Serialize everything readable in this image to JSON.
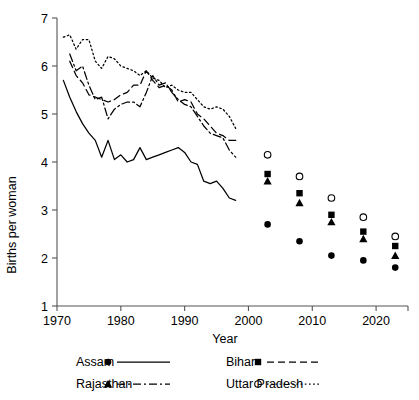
{
  "chart_data": {
    "type": "line",
    "title": "",
    "xlabel": "Year",
    "ylabel": "Births per woman",
    "xlim": [
      1970,
      2025
    ],
    "ylim": [
      1,
      7
    ],
    "xticks": [
      1970,
      1980,
      1990,
      2000,
      2010,
      2020
    ],
    "yticks": [
      1,
      2,
      3,
      4,
      5,
      6,
      7
    ],
    "grid": false,
    "legend_position": "below",
    "series": [
      {
        "name": "Assam",
        "marker": "filled-circle",
        "linestyle": "solid",
        "color": "#000000",
        "x": [
          1971,
          1972,
          1973,
          1974,
          1975,
          1976,
          1977,
          1978,
          1979,
          1980,
          1981,
          1982,
          1983,
          1984,
          1985,
          1986,
          1987,
          1988,
          1989,
          1990,
          1991,
          1992,
          1993,
          1994,
          1995,
          1996,
          1997,
          1998
        ],
        "values": [
          5.7,
          5.35,
          5.05,
          4.8,
          4.6,
          4.45,
          4.1,
          4.45,
          4.05,
          4.15,
          4.0,
          4.05,
          4.3,
          4.05,
          4.1,
          4.15,
          4.2,
          4.25,
          4.3,
          4.2,
          4.0,
          3.95,
          3.6,
          3.55,
          3.6,
          3.45,
          3.25,
          3.2
        ],
        "points_x": [
          2003,
          2008,
          2013,
          2018,
          2023
        ],
        "points_y": [
          2.7,
          2.35,
          2.05,
          1.95,
          1.8
        ]
      },
      {
        "name": "Bihar",
        "marker": "filled-square",
        "linestyle": "dashed",
        "color": "#000000",
        "x": [
          1972,
          1973,
          1974,
          1975,
          1976,
          1977,
          1978,
          1979,
          1980,
          1981,
          1982,
          1983,
          1984,
          1985,
          1986,
          1987,
          1988,
          1989,
          1990,
          1991,
          1992,
          1993,
          1994,
          1995,
          1996,
          1997,
          1998
        ],
        "values": [
          6.1,
          5.8,
          5.65,
          5.4,
          5.35,
          5.3,
          5.25,
          5.3,
          5.4,
          5.45,
          5.6,
          5.6,
          5.9,
          5.7,
          5.55,
          5.6,
          5.5,
          5.25,
          5.3,
          5.25,
          5.0,
          4.9,
          4.75,
          4.6,
          4.55,
          4.45,
          4.45
        ],
        "points_x": [
          2003,
          2008,
          2013,
          2018,
          2023
        ],
        "points_y": [
          3.75,
          3.35,
          2.9,
          2.55,
          2.25
        ]
      },
      {
        "name": "Rajasthan",
        "marker": "filled-triangle",
        "linestyle": "dashdot",
        "color": "#000000",
        "x": [
          1972,
          1973,
          1974,
          1975,
          1976,
          1977,
          1978,
          1979,
          1980,
          1981,
          1982,
          1983,
          1984,
          1985,
          1986,
          1987,
          1988,
          1989,
          1990,
          1991,
          1992,
          1993,
          1994,
          1995,
          1996,
          1997,
          1998
        ],
        "values": [
          6.25,
          5.9,
          6.0,
          5.6,
          5.3,
          5.35,
          4.9,
          5.1,
          5.2,
          5.25,
          5.25,
          5.15,
          5.45,
          5.8,
          5.6,
          5.65,
          5.45,
          5.3,
          5.2,
          5.15,
          4.95,
          4.75,
          4.6,
          4.55,
          4.5,
          4.25,
          4.1
        ],
        "points_x": [
          2003,
          2008,
          2013,
          2018,
          2023
        ],
        "points_y": [
          3.6,
          3.15,
          2.75,
          2.4,
          2.05
        ]
      },
      {
        "name": "Uttar Pradesh",
        "marker": "open-circle",
        "linestyle": "dotted",
        "color": "#000000",
        "x": [
          1971,
          1972,
          1973,
          1974,
          1975,
          1976,
          1977,
          1978,
          1979,
          1980,
          1981,
          1982,
          1983,
          1984,
          1985,
          1986,
          1987,
          1988,
          1989,
          1990,
          1991,
          1992,
          1993,
          1994,
          1995,
          1996,
          1997,
          1998
        ],
        "values": [
          6.6,
          6.65,
          6.35,
          6.55,
          6.55,
          6.1,
          5.95,
          6.2,
          6.15,
          6.0,
          5.95,
          5.9,
          5.8,
          5.9,
          5.75,
          5.7,
          5.55,
          5.6,
          5.5,
          5.45,
          5.45,
          5.3,
          5.15,
          5.1,
          5.15,
          5.1,
          4.95,
          4.7
        ],
        "points_x": [
          2003,
          2008,
          2013,
          2018,
          2023
        ],
        "points_y": [
          4.15,
          3.7,
          3.25,
          2.85,
          2.45
        ]
      }
    ]
  },
  "legend": {
    "entries": [
      {
        "label": "Assam",
        "marker": "filled-circle",
        "linestyle": "solid"
      },
      {
        "label": "Bihar",
        "marker": "filled-square",
        "linestyle": "dashed"
      },
      {
        "label": "Rajasthan",
        "marker": "filled-triangle",
        "linestyle": "dashdot"
      },
      {
        "label": "Uttar Pradesh",
        "marker": "open-circle",
        "linestyle": "dotted"
      }
    ]
  }
}
